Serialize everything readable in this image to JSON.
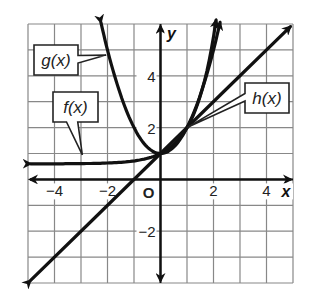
{
  "chart_data": {
    "type": "line",
    "title": "",
    "xlabel": "x",
    "ylabel": "y",
    "origin_label": "O",
    "xlim": [
      -5,
      5
    ],
    "ylim": [
      -4,
      6
    ],
    "grid": true,
    "x_ticks": [
      "−4",
      "−2",
      "2",
      "4"
    ],
    "y_ticks": [
      "4",
      "2",
      "−2"
    ],
    "series": [
      {
        "name": "f(x)",
        "label": "f(x)",
        "description": "exponential growth through (0,1), horizontal asymptote y=0",
        "x": [
          -5,
          -4,
          -3,
          -2,
          -1,
          0,
          1,
          2
        ],
        "values": [
          0.6,
          0.65,
          0.7,
          0.8,
          0.9,
          1,
          2,
          5
        ]
      },
      {
        "name": "g(x)",
        "label": "g(x)",
        "description": "parabola with vertex (0,1)",
        "x": [
          -2.2,
          -2,
          -1,
          0,
          1,
          2,
          2.2
        ],
        "values": [
          5.84,
          5,
          2,
          1,
          2,
          5,
          5.84
        ]
      },
      {
        "name": "h(x)",
        "label": "h(x)",
        "description": "line y = x + 1",
        "x": [
          -5,
          0,
          5
        ],
        "values": [
          -4,
          1,
          6
        ]
      }
    ]
  }
}
